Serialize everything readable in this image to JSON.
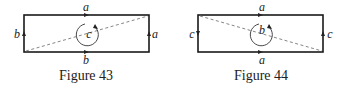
{
  "figures": [
    {
      "caption": "Figure 43",
      "labels": {
        "top": "a",
        "bottom": "b",
        "left": "b",
        "right": "a",
        "center": "c"
      },
      "diagonal": "bottom-left to top-right"
    },
    {
      "caption": "Figure 44",
      "labels": {
        "top": "a",
        "bottom": "a",
        "left": "c",
        "right": "c",
        "center": "b"
      },
      "diagonal": "top-left to bottom-right"
    }
  ]
}
